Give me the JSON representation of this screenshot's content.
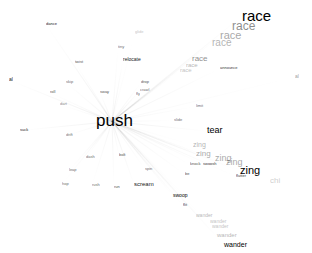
{
  "center": {
    "text": "push",
    "opacity": 1.0
  },
  "words": [
    {
      "text": "race",
      "x": 242,
      "y": 8,
      "s": 15,
      "o": 1.0
    },
    {
      "text": "race",
      "x": 232,
      "y": 20,
      "s": 12,
      "o": 0.45
    },
    {
      "text": "race",
      "x": 220,
      "y": 30,
      "s": 11,
      "o": 0.35
    },
    {
      "text": "race",
      "x": 212,
      "y": 38,
      "s": 10,
      "o": 0.3
    },
    {
      "text": "race",
      "x": 192,
      "y": 55,
      "s": 8,
      "o": 0.45
    },
    {
      "text": "race",
      "x": 186,
      "y": 62,
      "s": 6,
      "o": 0.3
    },
    {
      "text": "race",
      "x": 180,
      "y": 67,
      "s": 6,
      "o": 0.25
    },
    {
      "text": "tear",
      "x": 207,
      "y": 126,
      "s": 9,
      "o": 1.0
    },
    {
      "text": "zing",
      "x": 240,
      "y": 165,
      "s": 11,
      "o": 1.0
    },
    {
      "text": "zing",
      "x": 226,
      "y": 158,
      "s": 9,
      "o": 0.35
    },
    {
      "text": "zing",
      "x": 215,
      "y": 154,
      "s": 9,
      "o": 0.35
    },
    {
      "text": "zing",
      "x": 196,
      "y": 150,
      "s": 8,
      "o": 0.35
    },
    {
      "text": "zing",
      "x": 193,
      "y": 141,
      "s": 7,
      "o": 0.3
    },
    {
      "text": "chi",
      "x": 270,
      "y": 177,
      "s": 8,
      "o": 0.2
    },
    {
      "text": "wander",
      "x": 224,
      "y": 241,
      "s": 7,
      "o": 1.0
    },
    {
      "text": "wander",
      "x": 217,
      "y": 232,
      "s": 6,
      "o": 0.3
    },
    {
      "text": "wander",
      "x": 212,
      "y": 224,
      "s": 5,
      "o": 0.25
    },
    {
      "text": "wander",
      "x": 210,
      "y": 219,
      "s": 5,
      "o": 0.25
    },
    {
      "text": "wander",
      "x": 196,
      "y": 213,
      "s": 5,
      "o": 0.3
    },
    {
      "text": "swoop",
      "x": 173,
      "y": 193,
      "s": 5,
      "o": 1.0
    },
    {
      "text": "scream",
      "x": 134,
      "y": 181,
      "s": 6,
      "o": 0.9
    },
    {
      "text": "relocate",
      "x": 123,
      "y": 57,
      "s": 5,
      "o": 0.9
    },
    {
      "text": "dance",
      "x": 46,
      "y": 22,
      "s": 4,
      "o": 0.9
    },
    {
      "text": "suck",
      "x": 20,
      "y": 128,
      "s": 4,
      "o": 0.9
    },
    {
      "text": "flutter",
      "x": 236,
      "y": 174,
      "s": 4,
      "o": 0.8
    },
    {
      "text": "al",
      "x": 9,
      "y": 77,
      "s": 5,
      "o": 0.9
    },
    {
      "text": "al",
      "x": 295,
      "y": 74,
      "s": 5,
      "o": 0.4
    },
    {
      "text": "announce",
      "x": 220,
      "y": 66,
      "s": 4,
      "o": 0.8
    },
    {
      "text": "tiny",
      "x": 118,
      "y": 45,
      "s": 4,
      "o": 0.6
    },
    {
      "text": "limit",
      "x": 196,
      "y": 104,
      "s": 4,
      "o": 0.6
    },
    {
      "text": "knock",
      "x": 190,
      "y": 162,
      "s": 4,
      "o": 0.7
    },
    {
      "text": "swoosh",
      "x": 203,
      "y": 162,
      "s": 4,
      "o": 0.8
    },
    {
      "text": "be",
      "x": 185,
      "y": 172,
      "s": 4,
      "o": 0.7
    },
    {
      "text": "flit",
      "x": 183,
      "y": 203,
      "s": 4,
      "o": 0.8
    },
    {
      "text": "dash",
      "x": 86,
      "y": 155,
      "s": 4,
      "o": 0.6
    },
    {
      "text": "leap",
      "x": 69,
      "y": 168,
      "s": 4,
      "o": 0.6
    },
    {
      "text": "hop",
      "x": 62,
      "y": 182,
      "s": 4,
      "o": 0.6
    },
    {
      "text": "rush",
      "x": 92,
      "y": 183,
      "s": 4,
      "o": 0.6
    },
    {
      "text": "run",
      "x": 114,
      "y": 185,
      "s": 4,
      "o": 0.7
    },
    {
      "text": "bolt",
      "x": 119,
      "y": 153,
      "s": 4,
      "o": 0.7
    },
    {
      "text": "spin",
      "x": 145,
      "y": 167,
      "s": 4,
      "o": 0.6
    },
    {
      "text": "skip",
      "x": 66,
      "y": 80,
      "s": 4,
      "o": 0.6
    },
    {
      "text": "roll",
      "x": 50,
      "y": 90,
      "s": 4,
      "o": 0.7
    },
    {
      "text": "twist",
      "x": 75,
      "y": 60,
      "s": 4,
      "o": 0.7
    },
    {
      "text": "sway",
      "x": 100,
      "y": 90,
      "s": 4,
      "o": 0.7
    },
    {
      "text": "fly",
      "x": 136,
      "y": 92,
      "s": 4,
      "o": 0.6
    },
    {
      "text": "crawl",
      "x": 140,
      "y": 88,
      "s": 4,
      "o": 0.6
    },
    {
      "text": "drop",
      "x": 141,
      "y": 80,
      "s": 4,
      "o": 0.7
    },
    {
      "text": "slide",
      "x": 174,
      "y": 118,
      "s": 4,
      "o": 0.6
    },
    {
      "text": "dart",
      "x": 60,
      "y": 102,
      "s": 4,
      "o": 0.5
    },
    {
      "text": "drift",
      "x": 66,
      "y": 133,
      "s": 4,
      "o": 0.6
    },
    {
      "text": "glide",
      "x": 135,
      "y": 30,
      "s": 4,
      "o": 0.25
    }
  ],
  "center_label_x": 96,
  "center_label_y": 112
}
